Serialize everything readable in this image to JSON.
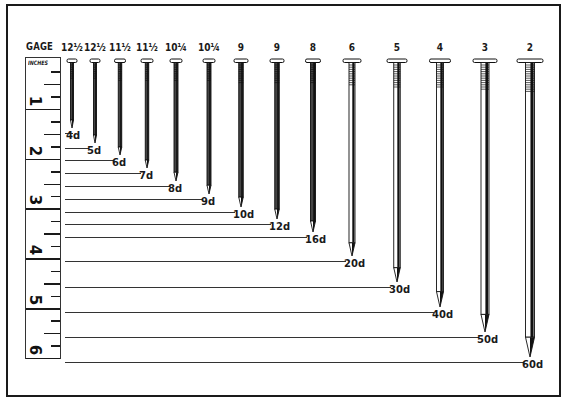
{
  "gage_header": "GAGE",
  "ruler": {
    "title": "INCHES",
    "inches": [
      "1",
      "2",
      "3",
      "4",
      "5",
      "6"
    ]
  },
  "nails": [
    {
      "gauge": "12½",
      "penny": "4d",
      "x": 72,
      "tip": 128,
      "head_w": 10,
      "shaft_w": 3
    },
    {
      "gauge": "12½",
      "penny": "5d",
      "x": 95,
      "tip": 143,
      "head_w": 10,
      "shaft_w": 3
    },
    {
      "gauge": "11½",
      "penny": "6d",
      "x": 120,
      "tip": 155,
      "head_w": 11,
      "shaft_w": 3.5
    },
    {
      "gauge": "11½",
      "penny": "7d",
      "x": 147,
      "tip": 168,
      "head_w": 12,
      "shaft_w": 3.5
    },
    {
      "gauge": "10¼",
      "penny": "8d",
      "x": 176,
      "tip": 181,
      "head_w": 12,
      "shaft_w": 4
    },
    {
      "gauge": "10¼",
      "penny": "9d",
      "x": 209,
      "tip": 194,
      "head_w": 12,
      "shaft_w": 4
    },
    {
      "gauge": "9",
      "penny": "10d",
      "x": 241,
      "tip": 207,
      "head_w": 14,
      "shaft_w": 4.5
    },
    {
      "gauge": "9",
      "penny": "12d",
      "x": 277,
      "tip": 219,
      "head_w": 14,
      "shaft_w": 4.5
    },
    {
      "gauge": "8",
      "penny": "16d",
      "x": 313,
      "tip": 232,
      "head_w": 15,
      "shaft_w": 5
    },
    {
      "gauge": "6",
      "penny": "20d",
      "x": 352,
      "tip": 256,
      "head_w": 18,
      "shaft_w": 6
    },
    {
      "gauge": "5",
      "penny": "30d",
      "x": 397,
      "tip": 282,
      "head_w": 20,
      "shaft_w": 6.5
    },
    {
      "gauge": "4",
      "penny": "40d",
      "x": 440,
      "tip": 307,
      "head_w": 21,
      "shaft_w": 7
    },
    {
      "gauge": "3",
      "penny": "50d",
      "x": 485,
      "tip": 332,
      "head_w": 24,
      "shaft_w": 8
    },
    {
      "gauge": "2",
      "penny": "60d",
      "x": 530,
      "tip": 357,
      "head_w": 26,
      "shaft_w": 9
    }
  ]
}
